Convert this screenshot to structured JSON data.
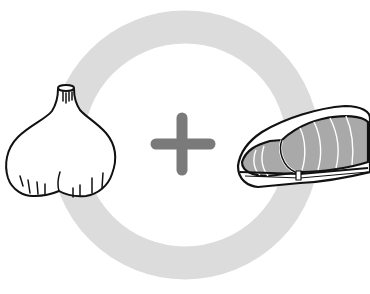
{
  "illustration": {
    "description": "Garlic plus meat",
    "left_item": "garlic",
    "operator": "+",
    "right_item": "meat",
    "colors": {
      "ring": "#dcdcdc",
      "plus": "#7a7a7a",
      "outline": "#111111",
      "meat_fill": "#a9a9a9",
      "background": "#ffffff"
    }
  }
}
